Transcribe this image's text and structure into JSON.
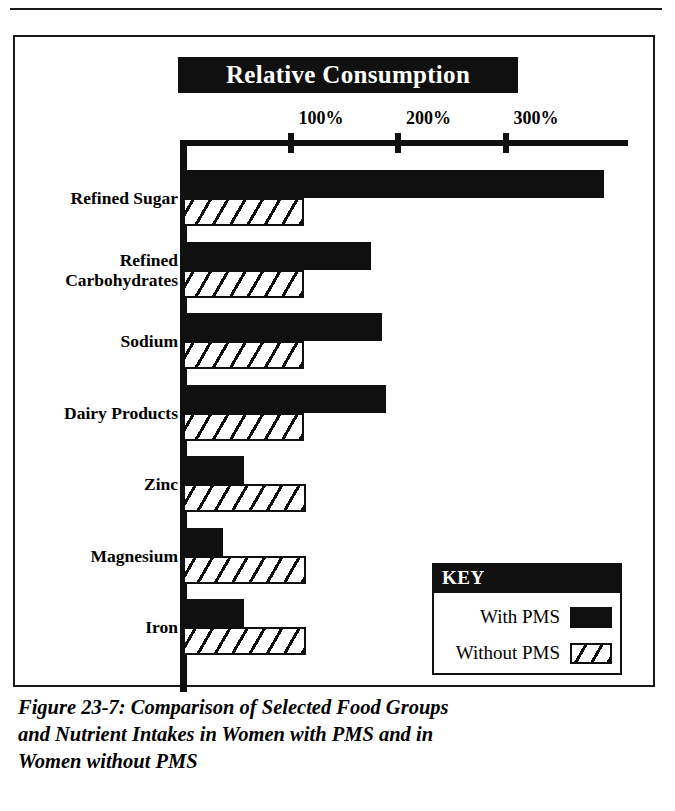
{
  "figure": {
    "title": "Relative Consumption",
    "caption": "Figure 23-7:  Comparison of Selected Food Groups\nand Nutrient Intakes in Women with PMS and in\nWomen without PMS"
  },
  "key": {
    "header": "KEY",
    "items": [
      {
        "label": "With PMS",
        "pattern": "solid"
      },
      {
        "label": "Without PMS",
        "pattern": "hatch"
      }
    ]
  },
  "colors": {
    "ink": "#101010",
    "paper": "#ffffff"
  },
  "chart_data": {
    "type": "bar",
    "orientation": "horizontal",
    "title": "Relative Consumption",
    "xlabel": "",
    "ylabel": "",
    "xlim": [
      0,
      415
    ],
    "xticks": [
      100,
      200,
      300
    ],
    "xticklabels": [
      "100%",
      "200%",
      "300%"
    ],
    "grid": false,
    "legend_position": "bottom-right",
    "categories": [
      "Refined Sugar",
      "Refined\nCarbohydrates",
      "Sodium",
      "Dairy Products",
      "Zinc",
      "Magnesium",
      "Iron"
    ],
    "series": [
      {
        "name": "With PMS",
        "pattern": "solid",
        "values": [
          392,
          175,
          185,
          189,
          57,
          37,
          57
        ]
      },
      {
        "name": "Without PMS",
        "pattern": "hatch",
        "values": [
          113,
          113,
          113,
          113,
          114,
          114,
          114
        ]
      }
    ]
  }
}
